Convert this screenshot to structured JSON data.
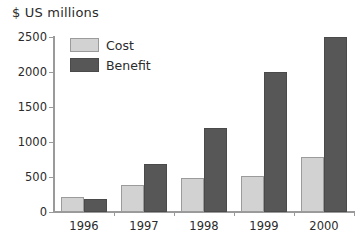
{
  "chart_data": {
    "type": "bar",
    "title": "$ US millions",
    "xlabel": "",
    "ylabel": "",
    "categories": [
      "1996",
      "1997",
      "1998",
      "1999",
      "2000"
    ],
    "series": [
      {
        "name": "Cost",
        "values": [
          210,
          380,
          480,
          520,
          790
        ],
        "color": "#d2d2d2"
      },
      {
        "name": "Benefit",
        "values": [
          180,
          680,
          1200,
          2000,
          2500
        ],
        "color": "#575757"
      }
    ],
    "ylim": [
      0,
      2500
    ],
    "yticks": [
      0,
      500,
      1000,
      1500,
      2000,
      2500
    ],
    "ytick_labels": [
      "0",
      "500",
      "1000",
      "1500",
      "2000",
      "2500"
    ],
    "grid": false,
    "legend_position": "top-left-inside"
  },
  "legend": {
    "entries": [
      {
        "label": "Cost"
      },
      {
        "label": "Benefit"
      }
    ]
  }
}
